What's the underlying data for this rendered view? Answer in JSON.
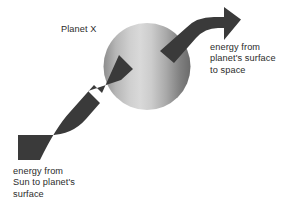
{
  "figure": {
    "type": "schematic-diagram",
    "background_color": "#ffffff"
  },
  "planet": {
    "label": "Planet X",
    "shape": "sphere",
    "center_x": 147,
    "center_y": 66,
    "radius": 43,
    "gradient": {
      "direction": "horizontal",
      "stops": [
        "#8f8f8f",
        "#c9c9c9",
        "#d8d8d8",
        "#a6a6a6",
        "#6e6e6e"
      ]
    }
  },
  "arrows": {
    "color": "#3a3a3a",
    "incoming": {
      "name": "energy-in-arrow",
      "label_lines": [
        "energy from",
        "Sun to planet's",
        "surface"
      ],
      "label_text": "energy from\nSun to planet's\nsurface",
      "direction": "up-right",
      "from": "lower-left",
      "to": "planet surface"
    },
    "outgoing": {
      "name": "energy-out-arrow",
      "label_lines": [
        "energy from",
        "planet's surface",
        "to space"
      ],
      "label_text": "energy from\nplanet's surface\nto space",
      "direction": "right",
      "from": "planet surface",
      "to": "space"
    }
  }
}
